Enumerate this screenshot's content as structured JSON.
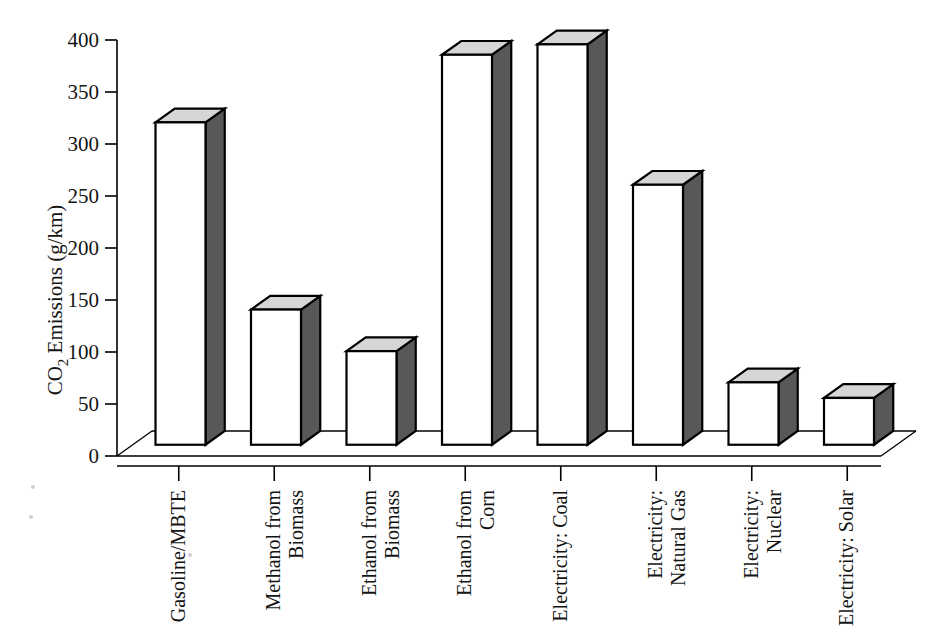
{
  "chart_data": {
    "type": "bar",
    "title": "",
    "subtitle": "",
    "xlabel": "",
    "ylabel": "CO2 Emissions (g/km)",
    "ylabel_parts": {
      "prefix": "CO",
      "subscript": "2",
      "suffix": " Emissions (g/km)"
    },
    "categories": [
      "Gasoline/MBTE",
      "Methanol from Biomass",
      "Ethanol from Biomass",
      "Ethanol from Corn",
      "Electricity: Coal",
      "Electricity: Natural Gas",
      "Electricity: Nuclear",
      "Electricity: Solar"
    ],
    "category_lines": [
      [
        "Gasoline/MBTE"
      ],
      [
        "Methanol from",
        "Biomass"
      ],
      [
        "Ethanol from",
        "Biomass"
      ],
      [
        "Ethanol from",
        "Corn"
      ],
      [
        "Electricity: Coal"
      ],
      [
        "Electricity:",
        "Natural Gas"
      ],
      [
        "Electricity:",
        "Nuclear"
      ],
      [
        "Electricity: Solar"
      ]
    ],
    "values": [
      310,
      130,
      90,
      375,
      385,
      250,
      60,
      45
    ],
    "ylim": [
      0,
      400
    ],
    "yticks": [
      0,
      50,
      100,
      150,
      200,
      250,
      300,
      350,
      400
    ],
    "ytick_labels": [
      "0",
      "50",
      "100",
      "150",
      "200",
      "250",
      "300",
      "350",
      "400"
    ],
    "grid": false,
    "legend": false,
    "legend_position": "none",
    "style": "3d-bar",
    "colors": {
      "bar_front": "#ffffff",
      "bar_side": "#585858",
      "bar_top": "#d6d6d6",
      "axis": "#000000",
      "text": "#141414",
      "background": "#ffffff"
    }
  }
}
